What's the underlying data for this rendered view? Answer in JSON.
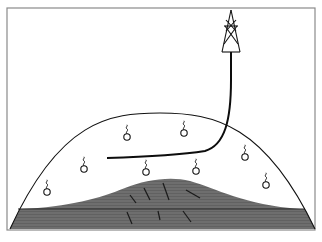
{
  "diagram": {
    "type": "reservoir-cross-section",
    "colors": {
      "background": "#ffffff",
      "frame": "#8a8a8a",
      "outline": "#111111",
      "water_zone": "#6e6e6e",
      "well_path": "#0d0d0d"
    },
    "frame": {
      "x": 7,
      "y": 8,
      "width": 308,
      "height": 222
    },
    "dome": {
      "base_left": [
        10,
        229
      ],
      "base_right": [
        315,
        229
      ],
      "apex": [
        160,
        113
      ]
    },
    "contact_line_y": 209,
    "water_hump_peak": [
      162,
      178
    ],
    "derrick": {
      "apex": [
        231,
        10
      ],
      "base_left": [
        222,
        52
      ],
      "base_right": [
        240,
        52
      ]
    },
    "well_path": {
      "surface": [
        231,
        52
      ],
      "bend": [
        205,
        152
      ],
      "toe": [
        107,
        158
      ]
    },
    "gas_bubbles": [
      {
        "cx": 127,
        "cy": 137
      },
      {
        "cx": 184,
        "cy": 133
      },
      {
        "cx": 84,
        "cy": 169
      },
      {
        "cx": 146,
        "cy": 172
      },
      {
        "cx": 196,
        "cy": 171
      },
      {
        "cx": 245,
        "cy": 157
      },
      {
        "cx": 266,
        "cy": 185
      },
      {
        "cx": 47,
        "cy": 192
      }
    ],
    "fractures": [
      [
        130,
        195,
        136,
        203
      ],
      [
        144,
        188,
        150,
        200
      ],
      [
        163,
        183,
        169,
        200
      ],
      [
        186,
        190,
        200,
        198
      ],
      [
        127,
        212,
        132,
        224
      ],
      [
        158,
        211,
        160,
        220
      ],
      [
        183,
        211,
        191,
        222
      ]
    ]
  }
}
